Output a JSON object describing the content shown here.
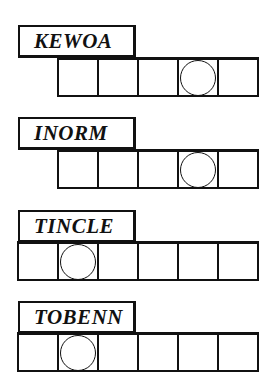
{
  "puzzle": {
    "type": "word-jumble",
    "clues": [
      {
        "scrambled": "KEWOA",
        "length": 5,
        "circled_positions": [
          4
        ],
        "answer_cells": [
          "",
          "",
          "",
          "",
          ""
        ]
      },
      {
        "scrambled": "INORM",
        "length": 5,
        "circled_positions": [
          4
        ],
        "answer_cells": [
          "",
          "",
          "",
          "",
          ""
        ]
      },
      {
        "scrambled": "TINCLE",
        "length": 6,
        "circled_positions": [
          2
        ],
        "answer_cells": [
          "",
          "",
          "",
          "",
          "",
          ""
        ]
      },
      {
        "scrambled": "TOBENN",
        "length": 6,
        "circled_positions": [
          2
        ],
        "answer_cells": [
          "",
          "",
          "",
          "",
          "",
          ""
        ]
      }
    ]
  },
  "colors": {
    "ink": "#111111",
    "paper": "#ffffff"
  }
}
